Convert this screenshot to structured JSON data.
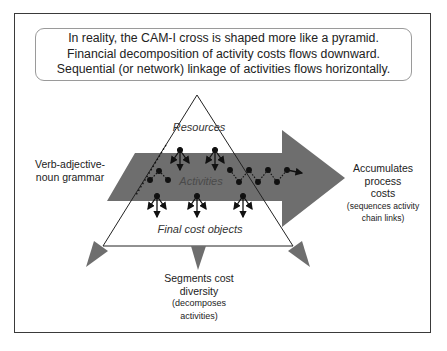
{
  "intro_box": {
    "lines": [
      "In reality, the CAM-I cross is shaped more like a pyramid.",
      "Financial decomposition of activity costs flows downward.",
      "Sequential (or network) linkage of activities flows horizontally."
    ]
  },
  "pyramid": {
    "top_label": "Resources",
    "middle_label": "Activities",
    "bottom_label": "Final cost objects"
  },
  "left_annotation": {
    "line1": "Verb-adjective-",
    "line2": "noun grammar"
  },
  "right_annotation": {
    "line1": "Accumulates",
    "line2": "process",
    "line3": "costs",
    "line4": "(sequences activity",
    "line5": "chain links)"
  },
  "bottom_annotation": {
    "line1": "Segments cost",
    "line2": "diversity",
    "line3": "(decomposes",
    "line4": "activities)"
  },
  "colors": {
    "arrow_fill": "#6e6e6e",
    "line": "#222222",
    "frame": "#3a3a3a",
    "box_border": "#9a9a9a"
  }
}
